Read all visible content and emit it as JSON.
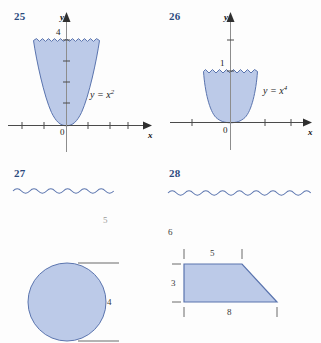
{
  "page": {
    "background_color": "#fdfdfd",
    "fill_color": "#b6c6e6",
    "stroke_color": "#5a74ae",
    "axis_color": "#4a4a4a",
    "number_color": "#2b4a7d"
  },
  "exercises": [
    {
      "number": "25",
      "type": "graph",
      "curve_label": "y = x",
      "curve_exponent": "2",
      "y_axis_label": "y",
      "x_axis_label": "x",
      "origin_label": "0",
      "y_tick_label": "4",
      "top_edge": "wavy",
      "description": "Region bounded above by the line y = 4 and below by the parabola y = x squared"
    },
    {
      "number": "26",
      "type": "graph",
      "curve_label": "y = x",
      "curve_exponent": "4",
      "y_axis_label": "y",
      "x_axis_label": "x",
      "origin_label": "0",
      "y_tick_label": "1",
      "top_edge": "wavy",
      "description": "Region bounded above by the line y = 1 and below by the quartic y = x to the fourth"
    },
    {
      "number": "27",
      "type": "solid-of-revolution",
      "shape": "circle",
      "dimensions": [
        {
          "name": "height-label",
          "value": "5"
        },
        {
          "name": "diameter-label",
          "value": "4"
        }
      ],
      "description": "A shaded circle with horizontal dimension lines above and below"
    },
    {
      "number": "28",
      "type": "solid-of-revolution",
      "shape": "trapezoid",
      "dimensions": [
        {
          "name": "axis-label",
          "value": "6"
        },
        {
          "name": "top-side-label",
          "value": "5"
        },
        {
          "name": "left-side-label",
          "value": "3"
        },
        {
          "name": "bottom-side-label",
          "value": "8"
        }
      ],
      "description": "A shaded trapezoid with top side 5, left side 3 and bottom side 8, offset 6 from the axis"
    }
  ]
}
